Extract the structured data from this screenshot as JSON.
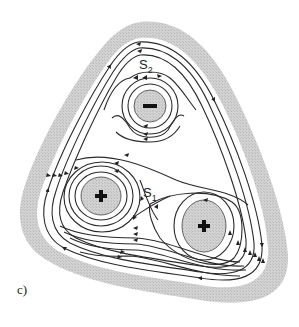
{
  "figure": {
    "panel_label": "c)",
    "charges": [
      {
        "sign": "-",
        "label": "−",
        "x": 150,
        "y": 106
      },
      {
        "sign": "+",
        "label": "+",
        "x": 101,
        "y": 196
      },
      {
        "sign": "+",
        "label": "+",
        "x": 204,
        "y": 226
      }
    ],
    "saddle_points": [
      {
        "name": "S",
        "sub": "2",
        "x": 146,
        "y": 64
      },
      {
        "name": "S",
        "sub": "1",
        "x": 148,
        "y": 196
      }
    ],
    "colors": {
      "line": "#2a2a2a",
      "shade": "#c8c8c8",
      "background": "#ffffff"
    }
  }
}
